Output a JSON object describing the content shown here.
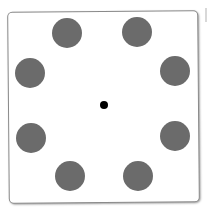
{
  "diagram": {
    "colors": {
      "circle": "#6b6b6b",
      "center": "#000000",
      "frame": "#8a8a8a",
      "background": "#ffffff"
    },
    "circles": [
      {
        "cx": 67,
        "cy": 33,
        "r": 15
      },
      {
        "cx": 137,
        "cy": 32,
        "r": 15
      },
      {
        "cx": 30,
        "cy": 73,
        "r": 15
      },
      {
        "cx": 175,
        "cy": 71,
        "r": 15
      },
      {
        "cx": 31,
        "cy": 138,
        "r": 15
      },
      {
        "cx": 175,
        "cy": 136,
        "r": 15
      },
      {
        "cx": 70,
        "cy": 176,
        "r": 15
      },
      {
        "cx": 138,
        "cy": 176,
        "r": 15
      }
    ],
    "center_dot": {
      "cx": 104,
      "cy": 105,
      "r": 4
    }
  }
}
